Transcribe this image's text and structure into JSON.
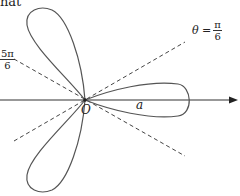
{
  "header_fragment": "hat",
  "diagram": {
    "type": "polar rose curve (three petals)",
    "origin_label": "O",
    "petal_label": "a",
    "line1": {
      "prefix": "θ = ",
      "numerator": "π",
      "denominator": "6"
    },
    "line2": {
      "numerator": "5π",
      "denominator": "6"
    },
    "colors": {
      "curve": "#555555",
      "axis": "#333333",
      "dashed": "#444444"
    }
  }
}
